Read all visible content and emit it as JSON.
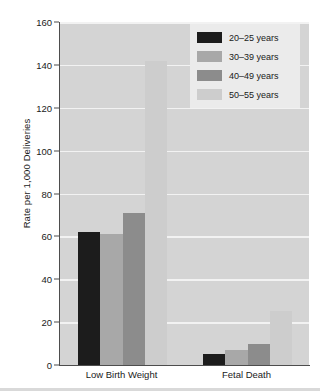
{
  "chart_data": {
    "type": "bar",
    "title": "",
    "xlabel": "",
    "ylabel": "Rate per 1,000 Deliveries",
    "ylim": [
      0,
      160
    ],
    "ytick_labels": [
      "160",
      "140",
      "120",
      "100",
      "80",
      "60",
      "40",
      "20",
      "0"
    ],
    "ytick_values": [
      160,
      140,
      120,
      100,
      80,
      60,
      40,
      20,
      0
    ],
    "grid": true,
    "grid_axis": "y",
    "legend_position": "top-right",
    "categories": [
      "Low Birth Weight",
      "Fetal Death"
    ],
    "series": [
      {
        "name": "20–25 years",
        "values": [
          62,
          5
        ],
        "color": "#1c1c1c"
      },
      {
        "name": "30–39 years",
        "values": [
          61,
          7
        ],
        "color": "#a8a8a8"
      },
      {
        "name": "40–49 years",
        "values": [
          71,
          10
        ],
        "color": "#8c8c8c"
      },
      {
        "name": "50–55 years",
        "values": [
          142,
          25
        ],
        "color": "#cdcdcd"
      }
    ]
  },
  "legend": {
    "items": [
      {
        "label": "20–25 years"
      },
      {
        "label": "30–39 years"
      },
      {
        "label": "40–49 years"
      },
      {
        "label": "50–55 years"
      }
    ]
  },
  "axes": {
    "y_title": "Rate per 1,000 Deliveries",
    "x_labels": [
      "Low Birth Weight",
      "Fetal Death"
    ]
  },
  "colors": {
    "plot_background": "#d4d4d4",
    "gridline": "#f2f2f2",
    "axis": "#4d4d4d",
    "legend_background": "#ebebeb",
    "text": "#1a1a1a"
  }
}
